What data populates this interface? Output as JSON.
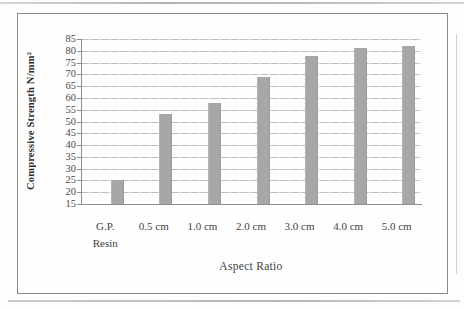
{
  "chart_data": {
    "type": "bar",
    "title": "",
    "categories": [
      "G.P.\nResin",
      "0.5 cm",
      "1.0 cm",
      "2.0 cm",
      "3.0 cm",
      "4.0 cm",
      "5.0 cm"
    ],
    "values": [
      25,
      53,
      58,
      69,
      78,
      81,
      82
    ],
    "xlabel": "Aspect Ratio",
    "ylabel": "Compressive Strength N/mm²",
    "ylim": [
      15,
      85
    ],
    "ytick_step": 5,
    "yticks": [
      15,
      20,
      25,
      30,
      35,
      40,
      45,
      50,
      55,
      60,
      65,
      70,
      75,
      80,
      85
    ],
    "grid": true,
    "legend": "none",
    "bar_color": "#a7a7a7",
    "gridline_color": "#c4c4c4",
    "axis_color": "#8d8d8d",
    "text_color": "#3f3f3f",
    "frame_border_color": "#8a8a8a"
  }
}
